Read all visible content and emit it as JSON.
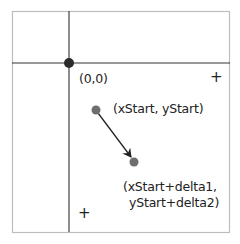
{
  "diagram": {
    "type": "coordinate-translation",
    "origin": {
      "label": "(0,0)",
      "x": 69,
      "y": 63
    },
    "start_point": {
      "label": "(xStart, yStart)",
      "x": 96,
      "y": 110
    },
    "end_point": {
      "label_line1": "(xStart+delta1,",
      "label_line2": "yStart+delta2)",
      "x": 134,
      "y": 162
    },
    "markers": {
      "plus_right": "+",
      "plus_bottom": "+"
    },
    "colors": {
      "frame": "#bdbdbd",
      "axis": "#333333",
      "origin_dot": "#2b2b2b",
      "point_dot": "#6e6e6e",
      "arrow": "#222222",
      "text": "#222222"
    }
  }
}
